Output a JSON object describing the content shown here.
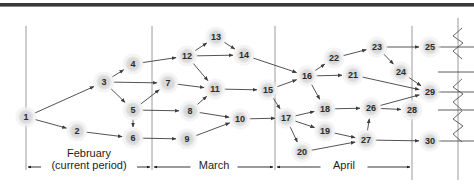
{
  "figure": {
    "title_rule": "top-divider-rule",
    "colors": {
      "node_fill": "#d9d9d9",
      "node_halo": "#ebebeb",
      "node_text": "#2b2b2b",
      "edge": "#4a4a4a",
      "timeline": "#1d1d1d",
      "divider": "#9a9a9a",
      "background": "#ffffff"
    }
  },
  "nodes": [
    {
      "id": "1",
      "label": "1",
      "x": 26,
      "y": 117
    },
    {
      "id": "2",
      "label": "2",
      "x": 77,
      "y": 131
    },
    {
      "id": "3",
      "label": "3",
      "x": 104,
      "y": 82
    },
    {
      "id": "4",
      "label": "4",
      "x": 133,
      "y": 64
    },
    {
      "id": "5",
      "label": "5",
      "x": 133,
      "y": 110
    },
    {
      "id": "6",
      "label": "6",
      "x": 133,
      "y": 138
    },
    {
      "id": "7",
      "label": "7",
      "x": 168,
      "y": 83
    },
    {
      "id": "8",
      "label": "8",
      "x": 190,
      "y": 111
    },
    {
      "id": "9",
      "label": "9",
      "x": 187,
      "y": 139
    },
    {
      "id": "10",
      "label": "10",
      "x": 240,
      "y": 119
    },
    {
      "id": "11",
      "label": "11",
      "x": 215,
      "y": 89
    },
    {
      "id": "12",
      "label": "12",
      "x": 187,
      "y": 56
    },
    {
      "id": "13",
      "label": "13",
      "x": 216,
      "y": 37
    },
    {
      "id": "14",
      "label": "14",
      "x": 244,
      "y": 55
    },
    {
      "id": "15",
      "label": "15",
      "x": 268,
      "y": 90
    },
    {
      "id": "16",
      "label": "16",
      "x": 307,
      "y": 76
    },
    {
      "id": "17",
      "label": "17",
      "x": 286,
      "y": 118
    },
    {
      "id": "18",
      "label": "18",
      "x": 325,
      "y": 109
    },
    {
      "id": "19",
      "label": "19",
      "x": 325,
      "y": 131
    },
    {
      "id": "20",
      "label": "20",
      "x": 302,
      "y": 152
    },
    {
      "id": "21",
      "label": "21",
      "x": 353,
      "y": 75
    },
    {
      "id": "22",
      "label": "22",
      "x": 334,
      "y": 58
    },
    {
      "id": "23",
      "label": "23",
      "x": 377,
      "y": 47
    },
    {
      "id": "24",
      "label": "24",
      "x": 401,
      "y": 72
    },
    {
      "id": "25",
      "label": "25",
      "x": 430,
      "y": 47
    },
    {
      "id": "26",
      "label": "26",
      "x": 371,
      "y": 108
    },
    {
      "id": "27",
      "label": "27",
      "x": 366,
      "y": 140
    },
    {
      "id": "28",
      "label": "28",
      "x": 412,
      "y": 110
    },
    {
      "id": "29",
      "label": "29",
      "x": 430,
      "y": 92
    },
    {
      "id": "30",
      "label": "30",
      "x": 430,
      "y": 141
    }
  ],
  "edges": [
    {
      "from": "1",
      "to": "3"
    },
    {
      "from": "1",
      "to": "2"
    },
    {
      "from": "2",
      "to": "6"
    },
    {
      "from": "3",
      "to": "4"
    },
    {
      "from": "3",
      "to": "7"
    },
    {
      "from": "3",
      "to": "5"
    },
    {
      "from": "4",
      "to": "12"
    },
    {
      "from": "5",
      "to": "8"
    },
    {
      "from": "5",
      "to": "6"
    },
    {
      "from": "5",
      "to": "7"
    },
    {
      "from": "6",
      "to": "9"
    },
    {
      "from": "7",
      "to": "11"
    },
    {
      "from": "8",
      "to": "11"
    },
    {
      "from": "8",
      "to": "10"
    },
    {
      "from": "9",
      "to": "10"
    },
    {
      "from": "10",
      "to": "17"
    },
    {
      "from": "11",
      "to": "15"
    },
    {
      "from": "12",
      "to": "13"
    },
    {
      "from": "12",
      "to": "14"
    },
    {
      "from": "12",
      "to": "11"
    },
    {
      "from": "13",
      "to": "14"
    },
    {
      "from": "14",
      "to": "16"
    },
    {
      "from": "15",
      "to": "16"
    },
    {
      "from": "15",
      "to": "17"
    },
    {
      "from": "16",
      "to": "22"
    },
    {
      "from": "16",
      "to": "21"
    },
    {
      "from": "16",
      "to": "18"
    },
    {
      "from": "17",
      "to": "18"
    },
    {
      "from": "17",
      "to": "19"
    },
    {
      "from": "17",
      "to": "20"
    },
    {
      "from": "18",
      "to": "26"
    },
    {
      "from": "19",
      "to": "27"
    },
    {
      "from": "20",
      "to": "27"
    },
    {
      "from": "21",
      "to": "29"
    },
    {
      "from": "22",
      "to": "23"
    },
    {
      "from": "23",
      "to": "25"
    },
    {
      "from": "23",
      "to": "24"
    },
    {
      "from": "24",
      "to": "29"
    },
    {
      "from": "26",
      "to": "28"
    },
    {
      "from": "26",
      "to": "29"
    },
    {
      "from": "27",
      "to": "26"
    },
    {
      "from": "27",
      "to": "30"
    }
  ],
  "dividers": [
    {
      "name": "left-boundary",
      "x": 26,
      "y1": 26,
      "y2": 170
    },
    {
      "name": "feb-march-split",
      "x": 152,
      "y1": 26,
      "y2": 170
    },
    {
      "name": "march-april-split",
      "x": 275,
      "y1": 26,
      "y2": 170
    },
    {
      "name": "april-end",
      "x": 412,
      "y1": 26,
      "y2": 180
    },
    {
      "name": "far-right-axis",
      "x": 458,
      "y1": 18,
      "y2": 180
    }
  ],
  "timeline": {
    "y": 167,
    "periods": [
      {
        "id": "february",
        "line1": "February",
        "line2": "(current period)",
        "x1": 26,
        "x2": 152,
        "label_x": 89,
        "two_line": true
      },
      {
        "id": "march",
        "line1": "March",
        "line2": "",
        "x1": 152,
        "x2": 275,
        "label_x": 214,
        "two_line": false
      },
      {
        "id": "april",
        "line1": "April",
        "line2": "",
        "x1": 275,
        "x2": 412,
        "label_x": 344,
        "two_line": false
      }
    ]
  },
  "break_marks": [
    {
      "name": "break-zigzag-top",
      "x": 458,
      "y": 44
    },
    {
      "name": "break-zigzag-middle",
      "x": 458,
      "y": 95
    },
    {
      "name": "break-zigzag-lower",
      "x": 458,
      "y": 127
    }
  ],
  "tail_lines": [
    {
      "name": "tail-25",
      "y": 47
    },
    {
      "name": "tail-24",
      "y": 72
    },
    {
      "name": "tail-29",
      "y": 92
    },
    {
      "name": "tail-28",
      "y": 110
    },
    {
      "name": "tail-30",
      "y": 141
    }
  ]
}
